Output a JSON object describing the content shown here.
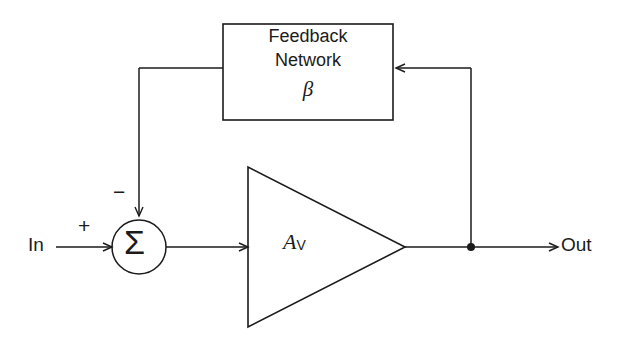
{
  "diagram": {
    "stroke_color": "#1b1b1b",
    "background_color": "#ffffff",
    "input_label": "In",
    "output_label": "Out",
    "summing_junction": {
      "symbol": "Σ",
      "positive_sign": "+",
      "negative_sign": "−"
    },
    "amplifier": {
      "symbol": "A",
      "subscript": "V"
    },
    "feedback_block": {
      "line1": "Feedback",
      "line2": "Network",
      "symbol": "β"
    }
  }
}
